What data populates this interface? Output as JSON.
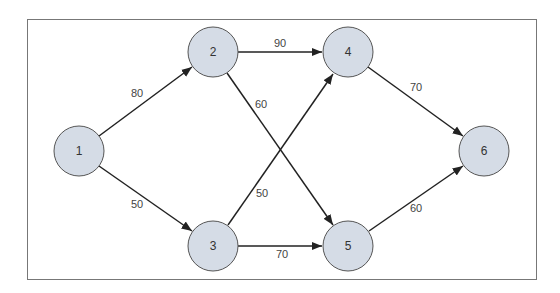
{
  "diagram": {
    "type": "directed-network",
    "colors": {
      "node_fill": "#d5dce6",
      "node_stroke": "#555555",
      "edge": "#222222",
      "frame": "#777777"
    },
    "nodes": [
      {
        "id": "1",
        "label": "1",
        "cx": 79,
        "cy": 151
      },
      {
        "id": "2",
        "label": "2",
        "cx": 213,
        "cy": 52
      },
      {
        "id": "3",
        "label": "3",
        "cx": 213,
        "cy": 246
      },
      {
        "id": "4",
        "label": "4",
        "cx": 348,
        "cy": 52
      },
      {
        "id": "5",
        "label": "5",
        "cx": 348,
        "cy": 246
      },
      {
        "id": "6",
        "label": "6",
        "cx": 484,
        "cy": 151
      }
    ],
    "edges": [
      {
        "from": "1",
        "to": "2",
        "weight": "80"
      },
      {
        "from": "1",
        "to": "3",
        "weight": "50"
      },
      {
        "from": "2",
        "to": "4",
        "weight": "90"
      },
      {
        "from": "2",
        "to": "5",
        "weight": "60"
      },
      {
        "from": "3",
        "to": "4",
        "weight": "50"
      },
      {
        "from": "3",
        "to": "5",
        "weight": "70"
      },
      {
        "from": "4",
        "to": "6",
        "weight": "70"
      },
      {
        "from": "5",
        "to": "6",
        "weight": "60"
      }
    ]
  }
}
